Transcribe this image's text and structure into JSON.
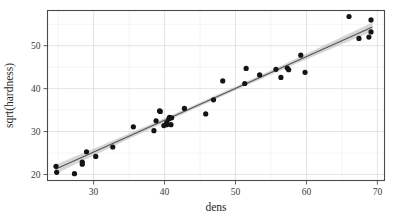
{
  "chart_data": {
    "type": "scatter",
    "title": "",
    "xlabel": "dens",
    "ylabel": "sqrt(hardness)",
    "xlim": [
      23.5,
      71.0
    ],
    "ylim": [
      18.6,
      58.2
    ],
    "xticks": [
      30,
      40,
      50,
      60,
      70
    ],
    "xtick_labels": [
      "30",
      "40",
      "50",
      "60",
      "70"
    ],
    "yticks": [
      20,
      30,
      40,
      50
    ],
    "ytick_labels": [
      "20",
      "30",
      "40",
      "50"
    ],
    "x_minor_step": 5,
    "y_minor_step": 5,
    "grid": true,
    "legend": "none",
    "point_color": "#141414",
    "line_color": "#555555",
    "band_color": "#b4b4b4",
    "panel_color": "#4a4a4a",
    "grid_color": "#d8d8d8",
    "marker_size": 2.6,
    "points": [
      {
        "x": 24.7,
        "y": 21.9
      },
      {
        "x": 24.8,
        "y": 20.5
      },
      {
        "x": 27.3,
        "y": 20.2
      },
      {
        "x": 28.4,
        "y": 22.4
      },
      {
        "x": 28.4,
        "y": 22.9
      },
      {
        "x": 29.0,
        "y": 25.3
      },
      {
        "x": 30.3,
        "y": 24.2
      },
      {
        "x": 32.7,
        "y": 26.4
      },
      {
        "x": 35.6,
        "y": 31.1
      },
      {
        "x": 38.5,
        "y": 30.2
      },
      {
        "x": 38.8,
        "y": 32.5
      },
      {
        "x": 39.3,
        "y": 34.8
      },
      {
        "x": 39.4,
        "y": 34.7
      },
      {
        "x": 39.9,
        "y": 31.4
      },
      {
        "x": 40.3,
        "y": 31.6
      },
      {
        "x": 40.3,
        "y": 32.1
      },
      {
        "x": 40.6,
        "y": 32.9
      },
      {
        "x": 40.7,
        "y": 33.3
      },
      {
        "x": 40.9,
        "y": 31.6
      },
      {
        "x": 41.0,
        "y": 33.2
      },
      {
        "x": 42.8,
        "y": 35.4
      },
      {
        "x": 45.8,
        "y": 34.1
      },
      {
        "x": 46.9,
        "y": 37.4
      },
      {
        "x": 48.2,
        "y": 41.8
      },
      {
        "x": 51.3,
        "y": 41.2
      },
      {
        "x": 51.5,
        "y": 44.7
      },
      {
        "x": 53.4,
        "y": 43.2
      },
      {
        "x": 55.7,
        "y": 44.5
      },
      {
        "x": 56.4,
        "y": 42.6
      },
      {
        "x": 57.3,
        "y": 44.8
      },
      {
        "x": 57.5,
        "y": 44.4
      },
      {
        "x": 59.2,
        "y": 47.8
      },
      {
        "x": 59.8,
        "y": 43.8
      },
      {
        "x": 66.0,
        "y": 56.8
      },
      {
        "x": 67.4,
        "y": 51.7
      },
      {
        "x": 68.8,
        "y": 52.0
      },
      {
        "x": 69.1,
        "y": 56.0
      },
      {
        "x": 69.1,
        "y": 53.2
      }
    ],
    "fit": {
      "type": "linear",
      "intercept": 2.95,
      "slope": 0.742,
      "band_halfwidth_center": 0.45,
      "band_halfwidth_edge": 1.15
    }
  }
}
